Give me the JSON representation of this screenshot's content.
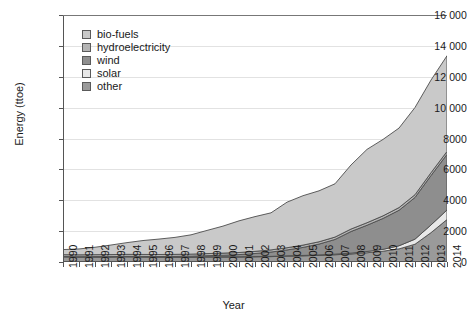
{
  "axes": {
    "y_title": "Energy (ttoe)",
    "x_title": "Year",
    "y_ticks": [
      "0",
      "2000",
      "4000",
      "6000",
      "8000",
      "10 000",
      "12 000",
      "14 000",
      "16 000"
    ],
    "y_min": 0,
    "y_max": 16000,
    "y_step": 2000
  },
  "legend": {
    "items": [
      {
        "label": "bio-fuels",
        "color": "#c9c9c9"
      },
      {
        "label": "hydroelectricity",
        "color": "#b4b4b4"
      },
      {
        "label": "wind",
        "color": "#8e8e8e"
      },
      {
        "label": "solar",
        "color": "#e8e8e8"
      },
      {
        "label": "other",
        "color": "#9a9a9a"
      }
    ]
  },
  "chart_data": {
    "type": "area",
    "stacked": true,
    "title": "",
    "xlabel": "Year",
    "ylabel": "Energy (ttoe)",
    "ylim": [
      0,
      16000
    ],
    "grid": true,
    "legend_position": "top-left-inside",
    "categories": [
      "1990",
      "1991",
      "1992",
      "1993",
      "1994",
      "1995",
      "1996",
      "1997",
      "1998",
      "1999",
      "2000",
      "2001",
      "2002",
      "2003",
      "2004",
      "2005",
      "2006",
      "2007",
      "2008",
      "2009",
      "2010",
      "2011",
      "2012",
      "2013",
      "2014"
    ],
    "stack_order_bottom_to_top": [
      "other",
      "solar",
      "wind",
      "hydroelectricity",
      "bio-fuels"
    ],
    "series": [
      {
        "name": "other",
        "color": "#9a9a9a",
        "values": [
          340,
          330,
          330,
          330,
          340,
          330,
          320,
          320,
          320,
          330,
          330,
          330,
          340,
          350,
          380,
          400,
          430,
          470,
          520,
          600,
          700,
          850,
          1150,
          1900,
          2750
        ]
      },
      {
        "name": "solar",
        "color": "#e8e8e8",
        "values": [
          10,
          10,
          10,
          10,
          10,
          10,
          10,
          10,
          10,
          10,
          10,
          10,
          10,
          15,
          20,
          25,
          30,
          40,
          55,
          80,
          120,
          200,
          330,
          500,
          620
        ]
      },
      {
        "name": "wind",
        "color": "#8e8e8e",
        "values": [
          5,
          5,
          10,
          10,
          15,
          20,
          25,
          35,
          50,
          70,
          100,
          140,
          200,
          280,
          380,
          520,
          700,
          950,
          1400,
          1700,
          2000,
          2300,
          2700,
          3200,
          3600
        ]
      },
      {
        "name": "hydroelectricity",
        "color": "#b4b4b4",
        "values": [
          120,
          120,
          125,
          130,
          130,
          130,
          130,
          130,
          130,
          135,
          135,
          135,
          140,
          140,
          145,
          150,
          150,
          155,
          160,
          165,
          170,
          175,
          180,
          185,
          190
        ]
      },
      {
        "name": "bio-fuels",
        "color": "#c9c9c9",
        "values": [
          330,
          380,
          480,
          620,
          760,
          900,
          1000,
          1100,
          1250,
          1500,
          1750,
          2050,
          2250,
          2400,
          2950,
          3200,
          3300,
          3450,
          4150,
          4750,
          4950,
          5150,
          5650,
          6000,
          6200
        ]
      }
    ],
    "totals": [
      805,
      845,
      955,
      1100,
      1255,
      1390,
      1485,
      1595,
      1760,
      2045,
      2325,
      2695,
      2940,
      3185,
      3875,
      4295,
      4610,
      5065,
      6285,
      7295,
      7940,
      8675,
      10010,
      11785,
      13360
    ]
  }
}
